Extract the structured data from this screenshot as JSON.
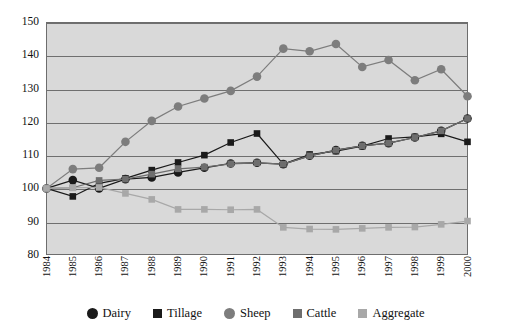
{
  "chart_data": {
    "type": "line",
    "title": "",
    "xlabel": "",
    "ylabel": "",
    "ylim": [
      80,
      150
    ],
    "yticks": [
      150,
      140,
      130,
      120,
      110,
      100,
      90,
      80
    ],
    "grid": true,
    "legend_position": "bottom",
    "background": "#d9d9d9",
    "gridline_color": "#6f6f6f",
    "x": [
      1984,
      1985,
      1986,
      1987,
      1988,
      1989,
      1990,
      1991,
      1992,
      1993,
      1994,
      1995,
      1996,
      1997,
      1998,
      1999,
      2000
    ],
    "categories": [
      "1984",
      "1985",
      "1986",
      "1987",
      "1988",
      "1989",
      "1990",
      "1991",
      "1992",
      "1993",
      "1994",
      "1995",
      "1996",
      "1997",
      "1998",
      "1999",
      "2000"
    ],
    "series": [
      {
        "name": "Dairy",
        "color": "#1a1a1a",
        "marker": "circle",
        "values": [
          100,
          102.5,
          100,
          102.8,
          103.3,
          104.8,
          106.2,
          107.5,
          107.7,
          107.3,
          109.8,
          111.5,
          112.8,
          113.6,
          115.3,
          117.3,
          121.0
        ]
      },
      {
        "name": "Tillage",
        "color": "#1a1a1a",
        "marker": "square",
        "values": [
          100,
          97.6,
          101.5,
          103.0,
          105.5,
          107.8,
          110.0,
          113.8,
          116.5,
          107.3,
          110.2,
          111.2,
          112.7,
          115.0,
          115.5,
          116.4,
          114.0
        ]
      },
      {
        "name": "Sheep",
        "color": "#7d7d7d",
        "marker": "circle",
        "values": [
          100,
          105.8,
          106.2,
          114.0,
          120.3,
          124.6,
          127.0,
          129.3,
          133.6,
          142.0,
          141.2,
          143.4,
          136.5,
          138.6,
          132.5,
          135.8,
          127.7
        ]
      },
      {
        "name": "Cattle",
        "color": "#6e6e6e",
        "marker": "square",
        "values": [
          100,
          100.2,
          102.4,
          102.8,
          104.3,
          105.9,
          106.4,
          107.4,
          107.7,
          107.3,
          109.8,
          111.5,
          112.8,
          113.6,
          115.3,
          117.3,
          121.0
        ]
      },
      {
        "name": "Aggregate",
        "color": "#a8a8a8",
        "marker": "square",
        "values": [
          100,
          100.2,
          100.3,
          98.5,
          96.7,
          93.7,
          93.7,
          93.6,
          93.7,
          88.3,
          87.8,
          87.7,
          88.0,
          88.3,
          88.4,
          89.2,
          90.2
        ]
      }
    ]
  },
  "legend": {
    "items": [
      {
        "label": "Dairy",
        "color": "#1a1a1a",
        "marker": "circle"
      },
      {
        "label": "Tillage",
        "color": "#1a1a1a",
        "marker": "square"
      },
      {
        "label": "Sheep",
        "color": "#7d7d7d",
        "marker": "circle"
      },
      {
        "label": "Cattle",
        "color": "#6e6e6e",
        "marker": "square"
      },
      {
        "label": "Aggregate",
        "color": "#a8a8a8",
        "marker": "square"
      }
    ]
  }
}
